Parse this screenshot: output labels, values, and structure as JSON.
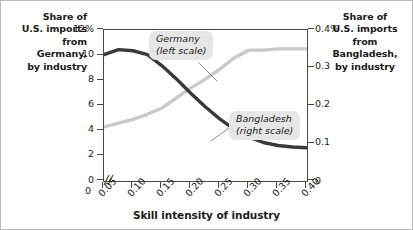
{
  "figure": {
    "left_axis_title": [
      "Share of",
      "U.S. imports",
      "from",
      "Germany,",
      "by industry"
    ],
    "right_axis_title": [
      "Share of",
      "U.S. imports",
      "from",
      "Bangladesh,",
      "by industry"
    ],
    "x_axis_title": "Skill intensity of industry",
    "germany_callout": {
      "line1": "Germany",
      "line2": "(left scale)"
    },
    "bangladesh_callout": {
      "line1": "Bangladesh",
      "line2": "(right scale)"
    },
    "colors": {
      "germany_line": "#c9c9c9",
      "bangladesh_line": "#3a3a3a",
      "axis": "#4a4a4a",
      "callout_bg": "#e6e6e6",
      "background": "#ffffff",
      "frame": "#b9b9b9"
    }
  },
  "chart_data": {
    "type": "line",
    "title": "",
    "subtitle": "",
    "xlabel": "Skill intensity of industry",
    "ylabel": "Share of U.S. imports from Germany, by industry",
    "y2label": "Share of U.S. imports from Bangladesh, by industry",
    "xlim": [
      0.05,
      0.4
    ],
    "ylim": [
      0,
      12
    ],
    "y2lim": [
      0,
      0.4
    ],
    "x_break": true,
    "grid": false,
    "legend_position": "inline-callout",
    "x_tick_labels": [
      "0",
      "0.05",
      "0.10",
      "0.15",
      "0.20",
      "0.25",
      "0.30",
      "0.35",
      "0.40"
    ],
    "y_tick_labels": [
      "0",
      "2",
      "4",
      "6",
      "8",
      "10",
      "12%"
    ],
    "y2_tick_labels": [
      "0",
      "0.1",
      "0.2",
      "0.3",
      "0.4%"
    ],
    "x": [
      0.05,
      0.075,
      0.1,
      0.125,
      0.15,
      0.175,
      0.2,
      0.225,
      0.25,
      0.275,
      0.3,
      0.325,
      0.35,
      0.375,
      0.4
    ],
    "series": [
      {
        "name": "Germany (left scale)",
        "axis": "left",
        "color": "#c9c9c9",
        "values": [
          4.3,
          4.6,
          4.9,
          5.3,
          5.8,
          6.6,
          7.4,
          8.1,
          8.9,
          9.8,
          10.4,
          10.4,
          10.5,
          10.5,
          10.5
        ]
      },
      {
        "name": "Bangladesh (right scale)",
        "axis": "right",
        "color": "#3a3a3a",
        "values": [
          0.335,
          0.348,
          0.345,
          0.335,
          0.305,
          0.27,
          0.232,
          0.196,
          0.164,
          0.137,
          0.116,
          0.102,
          0.094,
          0.09,
          0.088
        ]
      }
    ]
  }
}
